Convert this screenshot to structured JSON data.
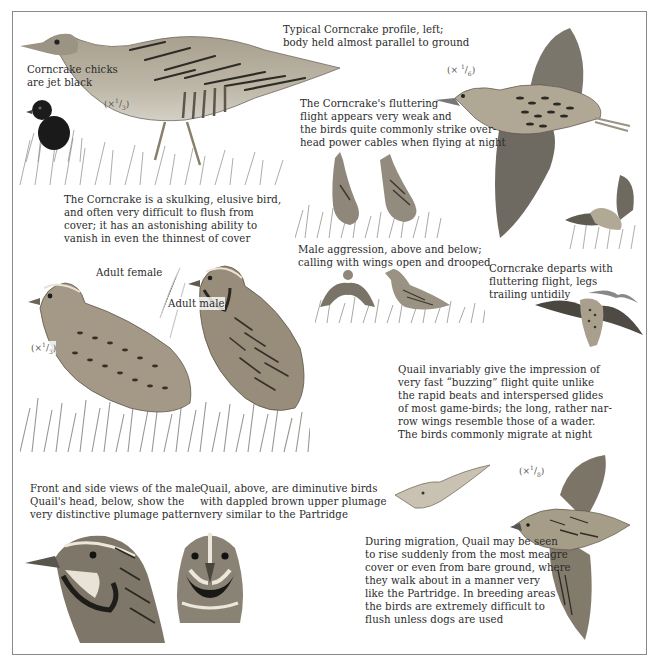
{
  "page": {
    "frame_color": "#8a8a8a",
    "text_color": "#2b2b2b"
  },
  "captions": {
    "corncrake_profile": "Typical Corncrake profile, left;\nbody held almost parallel to ground",
    "corncrake_chicks": "Corncrake chicks\nare jet black",
    "corncrake_flight": "The Corncrake's fluttering\nflight appears very weak and\nthe birds quite commonly strike over-\nhead power cables when flying at night",
    "corncrake_skulking": "The Corncrake is a skulking, elusive bird,\nand often very difficult to flush from\ncover; it has an astonishing ability to\nvanish in even the thinnest of cover",
    "male_aggression": "Male aggression, above and below;\ncalling with wings open and drooped",
    "corncrake_departs": "Corncrake departs with\nfluttering flight, legs\ntrailing untidily",
    "adult_female": "Adult female",
    "adult_male": "Adult male",
    "quail_flight": "Quail invariably give the impression of\nvery fast “buzzing” flight quite unlike\nthe rapid beats and interspersed glides\nof most game-birds; the long, rather nar-\nrow wings resemble those of a wader.\nThe birds commonly migrate at night",
    "quail_heads": "Front and side views of the male\nQuail's head, below, show the\nvery distinctive plumage pattern",
    "quail_diminutive": "Quail, above, are diminutive birds\nwith dappled brown upper plumage\nvery similar to the Partridge",
    "quail_migration": "During migration, Quail may be seen\nto rise suddenly from the most meagre\ncover or even from bare ground, where\nthey walk about in a manner very\nlike the Partridge. In breeding areas\nthe birds are extremely difficult to\nflush unless dogs are used"
  },
  "scales": {
    "corncrake_standing": {
      "prefix": "(×",
      "num": "1",
      "den": "3",
      "suffix": ")"
    },
    "corncrake_flying": {
      "prefix": "(× ",
      "num": "1",
      "den": "6",
      "suffix": ")"
    },
    "quail_standing": {
      "prefix": "(×",
      "num": "1",
      "den": "3",
      "suffix": ")"
    },
    "quail_flying": {
      "prefix": "(×",
      "num": "1",
      "den": "8",
      "suffix": ")"
    }
  },
  "illustrations": [
    {
      "id": "corncrake-profile",
      "subject": "Corncrake standing, side profile"
    },
    {
      "id": "corncrake-chick",
      "subject": "Corncrake chick, jet black"
    },
    {
      "id": "corncrake-flying",
      "subject": "Corncrake in flight"
    },
    {
      "id": "corncrake-calling",
      "subject": "Male Corncrakes calling"
    },
    {
      "id": "corncrake-display",
      "subject": "Male Corncrake aggression display"
    },
    {
      "id": "corncrake-departing",
      "subject": "Corncrake departing in flight"
    },
    {
      "id": "quail-female",
      "subject": "Adult female Quail"
    },
    {
      "id": "quail-male",
      "subject": "Adult male Quail"
    },
    {
      "id": "quail-head-side",
      "subject": "Male Quail head, side view"
    },
    {
      "id": "quail-head-front",
      "subject": "Male Quail head, front view"
    },
    {
      "id": "quail-flying-small",
      "subject": "Quail in flight, distant"
    },
    {
      "id": "quail-flying-large",
      "subject": "Quail in flight, close"
    }
  ]
}
